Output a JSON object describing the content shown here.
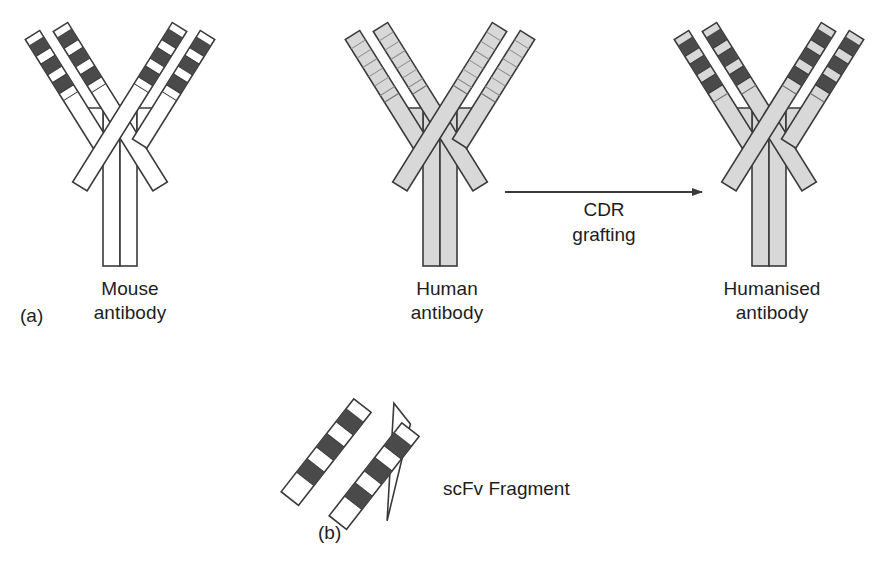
{
  "figure": {
    "background_color": "#ffffff",
    "ink_color": "#2b2b2b"
  },
  "colors": {
    "outline": "#3a3a3a",
    "cdr_band": "#4a4a4a",
    "human_fill": "#d8d8d8",
    "mouse_fill": "#ffffff",
    "framework_light": "#ededed",
    "arrow": "#3a3a3a"
  },
  "panels": [
    {
      "tag": "(a)",
      "caption": "Antibody humanisation by CDR grafting",
      "items": [
        {
          "name": "mouse-antibody",
          "label_line1": "Mouse",
          "label_line2": "antibody",
          "fill": "#ffffff",
          "has_dark_cdrs": true,
          "cdr_band_count": 3,
          "chain_count": 4
        },
        {
          "name": "human-antibody",
          "label_line1": "Human",
          "label_line2": "antibody",
          "fill": "#d8d8d8",
          "has_dark_cdrs": false,
          "cdr_band_count": 0,
          "chain_count": 4
        },
        {
          "name": "humanised-antibody",
          "label_line1": "Humanised",
          "label_line2": "antibody",
          "fill": "#d8d8d8",
          "has_dark_cdrs": true,
          "cdr_band_count": 3,
          "chain_count": 4
        }
      ],
      "arrow": {
        "label_line1": "CDR",
        "label_line2": "grafting",
        "direction": "right"
      }
    },
    {
      "tag": "(b)",
      "caption": "Single-chain variable fragment",
      "items": [
        {
          "name": "scfv-fragment",
          "label": "scFv Fragment",
          "fill": "#ffffff",
          "has_dark_cdrs": true,
          "cdr_band_count": 3,
          "domain_count": 2,
          "has_linker": true
        }
      ]
    }
  ]
}
